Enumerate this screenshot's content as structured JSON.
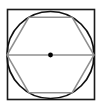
{
  "canvas": {
    "width": 103,
    "height": 108,
    "background": "#ffffff"
  },
  "figure": {
    "colors": {
      "square_stroke": "#1a1a1a",
      "circle_stroke": "#111111",
      "hexagon_stroke": "#8f8f8f",
      "diameter_stroke": "#8f8f8f",
      "center_dot_fill": "#000000",
      "background": "#ffffff"
    },
    "stroke_widths": {
      "square": 1.6,
      "circle": 1.7,
      "hexagon": 1.5,
      "diameter": 1.7
    },
    "square": {
      "label": "outer square",
      "x": 7.5,
      "y": 9.5,
      "width": 87,
      "height": 90
    },
    "circle": {
      "label": "inscribed circle",
      "cx": 50.5,
      "cy": 55,
      "r": 43.5
    },
    "hexagon": {
      "label": "inscribed regular hexagon",
      "orientation": "pointy-left-right",
      "points": "7.0,55 28.8,17.3 72.2,17.3 94.0,55 72.2,92.7 28.8,92.7",
      "vertices": [
        {
          "name": "left",
          "x": 7.0,
          "y": 55
        },
        {
          "name": "top-left",
          "x": 28.8,
          "y": 17.3
        },
        {
          "name": "top-right",
          "x": 72.2,
          "y": 17.3
        },
        {
          "name": "right",
          "x": 94.0,
          "y": 55
        },
        {
          "name": "bottom-right",
          "x": 72.2,
          "y": 92.7
        },
        {
          "name": "bottom-left",
          "x": 28.8,
          "y": 92.7
        }
      ]
    },
    "diameter": {
      "label": "horizontal diameter segment",
      "x1": 7.0,
      "y1": 55,
      "x2": 94.0,
      "y2": 55
    },
    "center_point": {
      "label": "center point marker",
      "cx": 50.5,
      "cy": 55,
      "r": 2.4
    }
  }
}
